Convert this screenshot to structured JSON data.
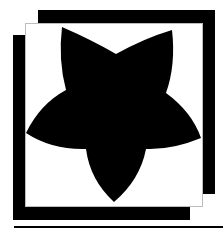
{
  "graphic": {
    "description": "Black five-pointed star with curved edges on white panel over offset black square frames",
    "colors": {
      "shape": "#000000",
      "panel": "#ffffff",
      "panel_border": "#bdbdbd",
      "background": "#ffffff"
    },
    "icon": "star-icon"
  }
}
